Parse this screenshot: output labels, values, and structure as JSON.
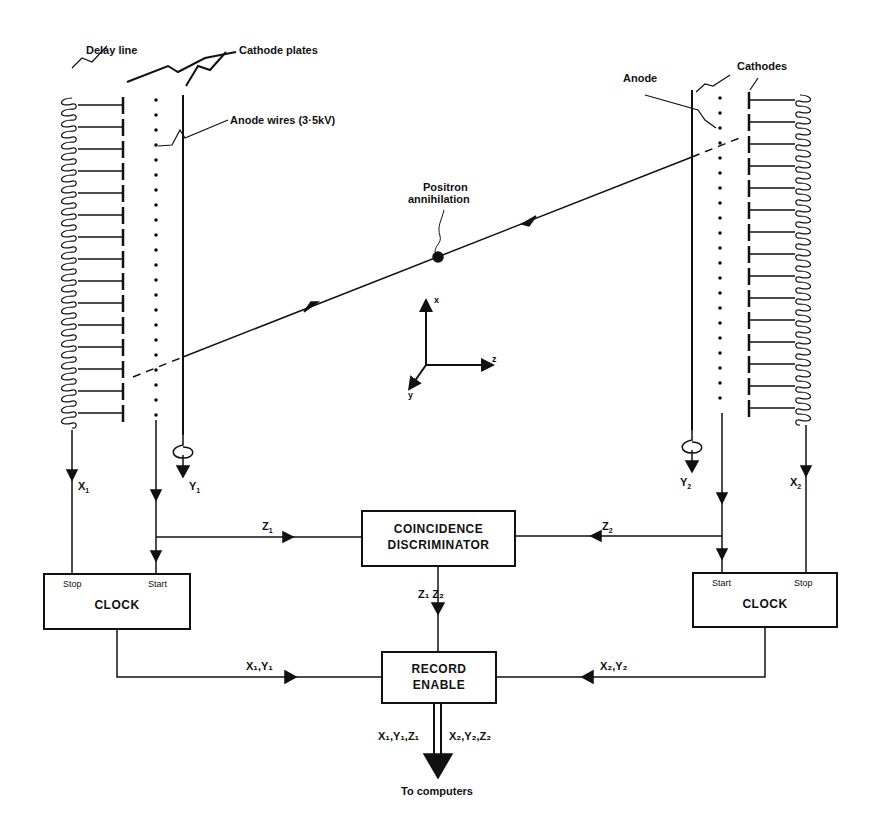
{
  "labels": {
    "delay_line": "Delay line",
    "cathode_plates": "Cathode plates",
    "anode_wires": "Anode wires (3·5kV)",
    "anode": "Anode",
    "cathodes": "Cathodes",
    "positron_line1": "Positron",
    "positron_line2": "annihilation",
    "to_computers": "To computers"
  },
  "axes": {
    "x": "x",
    "y": "y",
    "z": "z"
  },
  "boxes": {
    "clock_left": {
      "title": "CLOCK",
      "stop": "Stop",
      "start": "Start"
    },
    "clock_right": {
      "title": "CLOCK",
      "start": "Start",
      "stop": "Stop"
    },
    "coincidence": {
      "line1": "COINCIDENCE",
      "line2": "DISCRIMINATOR"
    },
    "record": {
      "line1": "RECORD",
      "line2": "ENABLE"
    }
  },
  "signals": {
    "x1": {
      "base": "X",
      "sub": "1"
    },
    "y1": {
      "base": "Y",
      "sub": "1"
    },
    "x2": {
      "base": "X",
      "sub": "2"
    },
    "y2": {
      "base": "Y",
      "sub": "2"
    },
    "z1": {
      "base": "Z",
      "sub": "1"
    },
    "z2": {
      "base": "Z",
      "sub": "2"
    },
    "z1z2": "Z₁ Z₂",
    "x1y1": "X₁,Y₁",
    "x2y2": "X₂,Y₂",
    "out_left": "X₁,Y₁,Z₁",
    "out_right": "X₂,Y₂,Z₂"
  },
  "colors": {
    "ink": "#111111",
    "paper": "#ffffff"
  }
}
